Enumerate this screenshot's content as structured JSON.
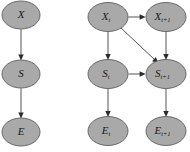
{
  "figure": {
    "background_color": "#ffffff",
    "node_fill_color": "#a9a9a9",
    "node_stroke_color": "#5d5d5d",
    "edge_color": "#4a4a4a",
    "label_color": "#1a1a1a"
  },
  "chart_data": {
    "type": "diagram",
    "title": "",
    "subtitle": "",
    "xlabel": "",
    "ylabel": "",
    "layout": "two probabilistic graphical models side by side; left is a static three-variable chain, right is a two-slice dynamic Bayesian network",
    "graphs": [
      {
        "id": "static-model",
        "name": "static-chain-graph",
        "nodes": [
          {
            "id": "X",
            "base": "X",
            "sub": "",
            "cx": 21,
            "cy": 15,
            "rx": 19,
            "ry": 14
          },
          {
            "id": "S",
            "base": "S",
            "sub": "",
            "cx": 21,
            "cy": 74,
            "rx": 19,
            "ry": 14
          },
          {
            "id": "E",
            "base": "E",
            "sub": "",
            "cx": 21,
            "cy": 132,
            "rx": 19,
            "ry": 14
          }
        ],
        "edges": [
          {
            "id": "X-to-S",
            "from": "X",
            "to": "S",
            "kind": "vertical"
          },
          {
            "id": "S-to-E",
            "from": "S",
            "to": "E",
            "kind": "vertical"
          }
        ]
      },
      {
        "id": "dynamic-model",
        "name": "two-slice-temporal-graph",
        "nodes": [
          {
            "id": "Xt",
            "base": "X",
            "sub": "t",
            "cx": 108,
            "cy": 17,
            "rx": 20,
            "ry": 14.5
          },
          {
            "id": "Xt1",
            "base": "X",
            "sub": "t+1",
            "cx": 166,
            "cy": 17,
            "rx": 20,
            "ry": 14.5
          },
          {
            "id": "St",
            "base": "S",
            "sub": "t",
            "cx": 108,
            "cy": 74,
            "rx": 20,
            "ry": 14.5
          },
          {
            "id": "St1",
            "base": "S",
            "sub": "t+1",
            "cx": 166,
            "cy": 74,
            "rx": 20,
            "ry": 14.5
          },
          {
            "id": "Et",
            "base": "E",
            "sub": "t",
            "cx": 108,
            "cy": 131,
            "rx": 20,
            "ry": 14.5
          },
          {
            "id": "Et1",
            "base": "E",
            "sub": "t+1",
            "cx": 166,
            "cy": 131,
            "rx": 20,
            "ry": 14.5
          }
        ],
        "edges": [
          {
            "id": "Xt-to-St",
            "from": "Xt",
            "to": "St",
            "kind": "vertical"
          },
          {
            "id": "St-to-Et",
            "from": "St",
            "to": "Et",
            "kind": "vertical"
          },
          {
            "id": "Xt-to-Xt1",
            "from": "Xt",
            "to": "Xt1",
            "kind": "horizontal"
          },
          {
            "id": "Xt-to-St1",
            "from": "Xt",
            "to": "St1",
            "kind": "diagonal"
          },
          {
            "id": "Xt1-to-St1",
            "from": "Xt1",
            "to": "St1",
            "kind": "vertical"
          },
          {
            "id": "St-to-St1",
            "from": "St",
            "to": "St1",
            "kind": "horizontal"
          },
          {
            "id": "St1-to-Et1",
            "from": "St1",
            "to": "Et1",
            "kind": "vertical"
          }
        ]
      }
    ]
  }
}
